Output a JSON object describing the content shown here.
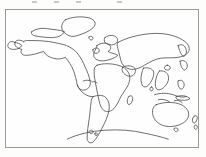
{
  "document": {
    "kind": "world-outline-map",
    "title": "Blank World Outline Map",
    "description": "Unlabeled line-art world map showing continental coastlines enclosed in a thin rectangular border",
    "background_color": "#fdfdfc",
    "paper_color": "#fefefe",
    "line_color": "#4a4a4a",
    "border_color": "#9a9a9a",
    "artifact_color": "#c9c9c9"
  },
  "frame": {
    "x": 5,
    "y": 9,
    "width": 194,
    "height": 139,
    "border_width": 1
  },
  "top_artifacts": {
    "description": "faint clipped tick marks along the very top edge",
    "positions": [
      32,
      54,
      76,
      117
    ]
  },
  "map": {
    "projection_hint": "equirectangular",
    "view_box": "0 0 194 139",
    "landmasses": [
      {
        "name": "greenland",
        "label": "Greenland",
        "path": "M60 10 C66 7 76 6 84 8 C90 10 92 14 88 18 C84 22 78 24 72 26 C66 28 62 26 58 22 C55 18 56 13 60 10 Z"
      },
      {
        "name": "north-america-mainland",
        "label": "North America",
        "path": "M18 32 C14 30 10 30 9 33 C8 37 12 39 16 40 C14 43 16 46 20 46 C26 46 32 44 38 42 C40 46 44 48 48 49 C52 50 56 50 60 48 C63 52 66 56 68 61 C70 66 71 71 72 76 C73 80 76 82 80 81 C84 80 86 76 85 72 C84 67 82 62 80 58 C78 53 76 49 73 45 C70 41 66 38 61 36 C55 34 49 33 43 32 C36 31 29 31 22 31 C20 31 19 31 18 32 Z"
      },
      {
        "name": "canadian-arctic",
        "label": "Canadian Arctic Archipelago",
        "path": "M26 22 C30 19 36 18 42 19 C48 20 54 20 59 22 C57 26 52 28 46 28 C40 28 33 27 28 26 C26 25 25 23 26 22 Z"
      },
      {
        "name": "alaska",
        "label": "Alaska",
        "path": "M9 33 C6 31 3 32 2 35 C1 38 4 40 8 40 C12 40 15 38 16 36 C14 34 11 33 9 33 Z"
      },
      {
        "name": "central-america",
        "label": "Central America",
        "path": "M72 76 C74 80 76 83 79 85 C82 87 85 88 88 88"
      },
      {
        "name": "south-america",
        "label": "South America",
        "path": "M88 88 C93 86 98 86 101 89 C104 92 105 97 104 102 C103 108 100 114 97 120 C94 126 91 131 88 134 C85 136 82 134 82 130 C82 124 83 117 84 111 C85 105 85 99 86 94 C86 91 87 89 88 88 Z"
      },
      {
        "name": "europe",
        "label": "Europe",
        "path": "M92 36 C96 33 101 33 104 35 C107 37 106 41 103 42 C106 44 110 44 113 46 C110 49 106 50 102 51 C98 52 94 52 91 50 C88 48 88 44 90 41 C91 39 92 37 92 36 Z"
      },
      {
        "name": "scandinavia",
        "label": "Scandinavia",
        "path": "M100 28 C104 25 109 25 112 28 C114 31 112 34 109 35 C106 36 102 35 100 33 C99 31 99 29 100 28 Z"
      },
      {
        "name": "british-isles",
        "label": "British Isles",
        "path": "M88 40 C90 38 93 38 94 40 C95 42 93 44 91 44 C89 44 87 42 88 40 Z"
      },
      {
        "name": "africa",
        "label": "Africa",
        "path": "M92 56 C98 54 106 54 113 56 C118 57 122 60 124 64 C126 68 125 73 123 77 C121 81 118 84 116 88 C114 92 112 97 109 100 C106 103 102 104 99 102 C96 100 95 96 94 92 C93 87 92 82 91 77 C90 72 89 67 89 62 C89 59 90 57 92 56 Z"
      },
      {
        "name": "madagascar",
        "label": "Madagascar",
        "path": "M124 88 C126 86 128 87 128 90 C128 93 126 96 124 96 C122 95 122 90 124 88 Z"
      },
      {
        "name": "asia-northern",
        "label": "Northern Asia (Siberia)",
        "path": "M113 33 C122 28 134 25 146 24 C158 23 168 25 176 29 C182 32 186 36 185 41 C184 45 179 47 174 48 C168 49 162 48 156 49 C150 50 145 53 140 56 C135 59 130 61 125 60 C120 59 117 55 116 51 C115 47 114 43 113 39 C112 36 112 34 113 33 Z"
      },
      {
        "name": "arabian-peninsula",
        "label": "Arabian Peninsula",
        "path": "M118 58 C122 56 127 56 130 59 C132 62 130 66 127 67 C124 68 120 66 118 63 C117 61 117 59 118 58 Z"
      },
      {
        "name": "india",
        "label": "Indian Subcontinent",
        "path": "M139 59 C143 58 147 59 149 62 C150 66 148 71 145 75 C143 78 140 79 138 77 C136 74 136 69 137 65 C138 62 138 60 139 59 Z"
      },
      {
        "name": "southeast-asia",
        "label": "Southeast Asia",
        "path": "M155 62 C159 61 163 63 164 67 C165 71 163 75 160 78 C157 81 154 82 152 80 C150 77 151 72 152 68 C153 65 154 63 155 62 Z"
      },
      {
        "name": "indonesia",
        "label": "Indonesian Archipelago",
        "path": "M150 86 C156 84 163 84 169 86 C174 88 178 89 182 88 M154 91 C158 90 162 91 165 93 M170 92 C173 91 176 92 178 94"
      },
      {
        "name": "japan",
        "label": "Japan",
        "path": "M176 52 C179 50 182 52 183 55 C184 58 182 61 180 61 C178 60 176 56 176 52 Z"
      },
      {
        "name": "korea-kamchatka",
        "label": "Kamchatka Peninsula",
        "path": "M174 36 C178 34 181 36 182 40 C183 44 181 47 179 47 C177 46 175 41 174 36 Z"
      },
      {
        "name": "philippines",
        "label": "Philippines",
        "path": "M174 72 C177 70 180 72 180 76 C180 79 178 81 176 80 C174 78 173 74 174 72 Z"
      },
      {
        "name": "australia",
        "label": "Australia",
        "path": "M152 96 C160 93 170 93 177 96 C183 99 186 104 184 109 C182 114 176 117 169 118 C162 119 156 117 152 113 C148 109 147 103 149 99 C150 97 151 96 152 96 Z"
      },
      {
        "name": "tasmania",
        "label": "Tasmania",
        "path": "M170 120 C172 119 174 120 174 122 C173 124 171 124 170 122 Z"
      },
      {
        "name": "new-zealand",
        "label": "New Zealand",
        "path": "M190 108 C192 106 194 108 193 111 C192 114 190 116 189 114 C188 112 188 109 190 108 Z M191 117 C193 116 194 118 193 120 C192 122 190 121 190 119 Z"
      },
      {
        "name": "new-guinea",
        "label": "New Guinea",
        "path": "M172 88 C177 86 183 87 186 90 C183 92 178 92 174 91 C172 90 171 89 172 88 Z"
      },
      {
        "name": "antarctica",
        "label": "Antarctica",
        "path": "M62 131 C72 126 86 123 100 122 C114 121 128 122 140 125 C150 127 158 129 164 131"
      },
      {
        "name": "southern-tip-islands",
        "label": "Falkland / southern islands",
        "path": "M84 123 C86 121 88 122 88 124 C87 126 85 126 84 124 Z M90 125 C92 124 93 126 92 127 C90 128 89 126 90 125 Z"
      },
      {
        "name": "iceland",
        "label": "Iceland",
        "path": "M84 27 C86 26 88 27 88 29 C87 31 85 31 84 29 Z"
      },
      {
        "name": "caribbean-islands",
        "label": "Caribbean Islands",
        "path": "M78 72 C81 71 84 71 86 72 M87 73 C89 72 91 73 92 74"
      },
      {
        "name": "mid-pacific-island",
        "label": "Pacific island",
        "path": "M163 56 a3 2.5 0 1 0 0.1 0 Z"
      },
      {
        "name": "sri-lanka",
        "label": "Sri Lanka",
        "path": "M147 78 a1.6 2 0 1 0 0.1 0 Z"
      }
    ]
  }
}
